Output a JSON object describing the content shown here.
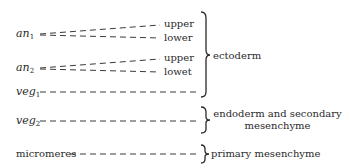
{
  "cells": [
    {
      "name": "an",
      "sub": "1",
      "italic": true,
      "top": 28
    },
    {
      "name": "an",
      "sub": "2",
      "italic": true,
      "top": 62
    },
    {
      "name": "veg",
      "sub": "1",
      "italic": true,
      "top": 86
    },
    {
      "name": "veg",
      "sub": "2",
      "italic": true,
      "top": 115
    },
    {
      "name": "micromeres",
      "sub": "",
      "italic": false,
      "top": 148
    }
  ],
  "tiers": {
    "an1_upper": "upper",
    "an1_lower": "lower",
    "an2_upper": "upper",
    "an2_lower": "lowet"
  },
  "groups": {
    "ectoderm": "ectoderm",
    "endoderm_line1": "endoderm and secondary",
    "endoderm_line2": "mesenchyme",
    "primary": "primary mesenchyme"
  },
  "colors": {
    "ink": "#2a2a2a",
    "background": "#ffffff"
  }
}
